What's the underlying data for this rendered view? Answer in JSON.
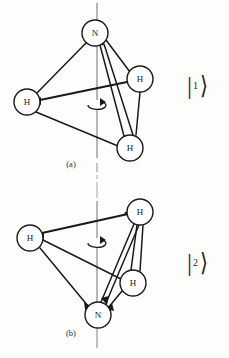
{
  "figure": {
    "caption_a": "(a)",
    "caption_b": "(b)",
    "stroke_color": "#1a1a1a",
    "axis_color": "#8a8a8a",
    "circle_fill": "#ffffff",
    "background": "#fdfdfc"
  },
  "panel_a": {
    "label": "(a)",
    "ket": {
      "bar": "|",
      "number": "1",
      "angle": "⟩"
    },
    "atoms": [
      {
        "name": "nitrogen",
        "symbol": "N",
        "cx": 95,
        "cy": 33,
        "r": 13
      },
      {
        "name": "hydrogen-left",
        "symbol": "H",
        "cx": 27,
        "cy": 102,
        "r": 13
      },
      {
        "name": "hydrogen-right",
        "symbol": "H",
        "cx": 140,
        "cy": 79,
        "r": 13
      },
      {
        "name": "hydrogen-bottom",
        "symbol": "H",
        "cx": 130,
        "cy": 148,
        "r": 13
      }
    ],
    "bonds": [
      {
        "from": "nitrogen",
        "to": "hydrogen-left"
      },
      {
        "from": "nitrogen",
        "to": "hydrogen-right"
      },
      {
        "from": "nitrogen",
        "to": "hydrogen-bottom"
      },
      {
        "from": "hydrogen-left",
        "to": "hydrogen-right"
      },
      {
        "from": "hydrogen-left",
        "to": "hydrogen-bottom"
      },
      {
        "from": "hydrogen-right",
        "to": "hydrogen-bottom"
      }
    ],
    "axis": {
      "x": 97,
      "y1": 3,
      "y2": 176
    },
    "rotation_marker": {
      "cx": 97,
      "cy": 105,
      "rx": 9,
      "ry": 4
    }
  },
  "panel_b": {
    "label": "(b)",
    "ket": {
      "bar": "|",
      "number": "2",
      "angle": "⟩"
    },
    "atoms": [
      {
        "name": "hydrogen-left",
        "symbol": "H",
        "cx": 30,
        "cy": 238,
        "r": 13
      },
      {
        "name": "hydrogen-topright",
        "symbol": "H",
        "cx": 140,
        "cy": 212,
        "r": 13
      },
      {
        "name": "hydrogen-middle",
        "symbol": "H",
        "cx": 133,
        "cy": 283,
        "r": 13
      },
      {
        "name": "nitrogen",
        "symbol": "N",
        "cx": 98,
        "cy": 315,
        "r": 13
      }
    ],
    "bonds": [
      {
        "from": "nitrogen",
        "to": "hydrogen-left"
      },
      {
        "from": "nitrogen",
        "to": "hydrogen-topright"
      },
      {
        "from": "nitrogen",
        "to": "hydrogen-middle"
      },
      {
        "from": "hydrogen-left",
        "to": "hydrogen-topright"
      },
      {
        "from": "hydrogen-left",
        "to": "hydrogen-middle"
      },
      {
        "from": "hydrogen-topright",
        "to": "hydrogen-middle"
      }
    ],
    "axis": {
      "x": 97,
      "y1": 182,
      "y2": 350
    },
    "rotation_marker": {
      "cx": 97,
      "cy": 243,
      "rx": 9,
      "ry": 4
    }
  }
}
